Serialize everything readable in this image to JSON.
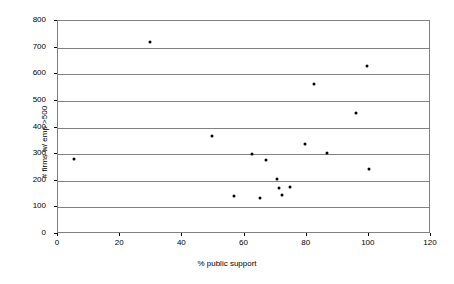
{
  "chart_data": {
    "type": "scatter",
    "title": "",
    "xlabel": "% public support",
    "ylabel": "# firms w/ emp >500",
    "xlim": [
      0,
      120
    ],
    "ylim": [
      0,
      800
    ],
    "xticks": [
      0,
      20,
      40,
      60,
      80,
      100,
      120
    ],
    "yticks": [
      0,
      100,
      200,
      300,
      400,
      500,
      600,
      700,
      800
    ],
    "grid": "horizontal",
    "legend": "none",
    "marker": "filled-diamond",
    "marker_color": "#000000",
    "series": [
      {
        "name": "firms",
        "points": [
          {
            "x": 5,
            "y": 280
          },
          {
            "x": 29.5,
            "y": 722
          },
          {
            "x": 49.5,
            "y": 368
          },
          {
            "x": 56.5,
            "y": 143
          },
          {
            "x": 62.5,
            "y": 302
          },
          {
            "x": 65,
            "y": 135
          },
          {
            "x": 67,
            "y": 277
          },
          {
            "x": 70.5,
            "y": 205
          },
          {
            "x": 71,
            "y": 172
          },
          {
            "x": 72,
            "y": 146
          },
          {
            "x": 74.5,
            "y": 175
          },
          {
            "x": 79.5,
            "y": 337
          },
          {
            "x": 82.5,
            "y": 565
          },
          {
            "x": 86.5,
            "y": 305
          },
          {
            "x": 96,
            "y": 455
          },
          {
            "x": 99.5,
            "y": 630
          },
          {
            "x": 100,
            "y": 243
          }
        ]
      }
    ]
  }
}
